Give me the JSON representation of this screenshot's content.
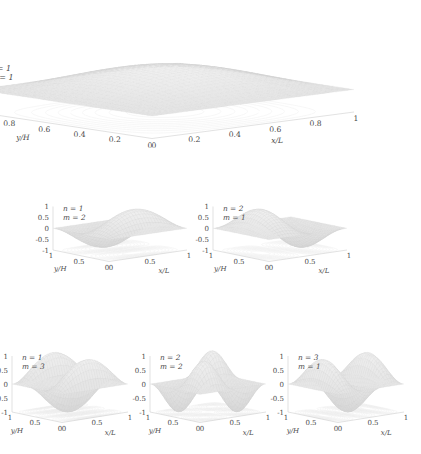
{
  "figure": {
    "axis_labels": {
      "x": "x/L",
      "y": "y/H",
      "z": ""
    }
  },
  "chart_data": {
    "type": "surface",
    "xlabel": "x/L",
    "ylabel": "y/H",
    "zlabel": "",
    "grid": false,
    "legend": "none",
    "panels": [
      {
        "id": "panel-n1-m1",
        "n": 1,
        "m": 1,
        "label_n": "n = 1",
        "label_m": "m = 1",
        "zlim": [
          0,
          2
        ],
        "zticks": [
          "2",
          "1.5",
          "1",
          "0.5",
          "0"
        ],
        "ztick_values": [
          2,
          1.5,
          1,
          0.5,
          0
        ],
        "xlim": [
          0,
          1
        ],
        "ylim": [
          0,
          1
        ],
        "xticks": [
          "0",
          "0.2",
          "0.4",
          "0.6",
          "0.8",
          "1"
        ],
        "xtick_values": [
          0,
          0.2,
          0.4,
          0.6,
          0.8,
          1
        ],
        "yticks": [
          "1",
          "0.8",
          "0.6",
          "0.4",
          "0.2",
          "0"
        ],
        "ytick_values": [
          1,
          0.8,
          0.6,
          0.4,
          0.2,
          0
        ],
        "xlabel": "x/L",
        "ylabel": "y/H",
        "offset": 1,
        "amplitude": 1,
        "size": "large"
      },
      {
        "id": "panel-n1-m2",
        "n": 1,
        "m": 2,
        "label_n": "n = 1",
        "label_m": "m = 2",
        "zlim": [
          -1,
          1
        ],
        "zticks": [
          "1",
          "0.5",
          "0",
          "-0.5",
          "-1"
        ],
        "ztick_values": [
          1,
          0.5,
          0,
          -0.5,
          -1
        ],
        "xlim": [
          0,
          1
        ],
        "ylim": [
          0,
          1
        ],
        "xticks": [
          "0",
          "0.5",
          "1"
        ],
        "xtick_values": [
          0,
          0.5,
          1
        ],
        "yticks": [
          "1",
          "0.5",
          "0"
        ],
        "ytick_values": [
          1,
          0.5,
          0
        ],
        "xlabel": "x/L",
        "ylabel": "y/H",
        "offset": 0,
        "amplitude": 1,
        "size": "small"
      },
      {
        "id": "panel-n2-m1",
        "n": 2,
        "m": 1,
        "label_n": "n = 2",
        "label_m": "m = 1",
        "zlim": [
          -1,
          1
        ],
        "zticks": [
          "1",
          "0.5",
          "0",
          "-0.5",
          "-1"
        ],
        "ztick_values": [
          1,
          0.5,
          0,
          -0.5,
          -1
        ],
        "xlim": [
          0,
          1
        ],
        "ylim": [
          0,
          1
        ],
        "xticks": [
          "0",
          "0.5",
          "1"
        ],
        "xtick_values": [
          0,
          0.5,
          1
        ],
        "yticks": [
          "1",
          "0.5",
          "0"
        ],
        "ytick_values": [
          1,
          0.5,
          0
        ],
        "xlabel": "x/L",
        "ylabel": "y/H",
        "offset": 0,
        "amplitude": 1,
        "size": "small"
      },
      {
        "id": "panel-n1-m3",
        "n": 1,
        "m": 3,
        "label_n": "n = 1",
        "label_m": "m = 3",
        "zlim": [
          -1,
          1
        ],
        "zticks": [
          "1",
          "0.5",
          "0",
          "-0.5",
          "-1"
        ],
        "ztick_values": [
          1,
          0.5,
          0,
          -0.5,
          -1
        ],
        "xlim": [
          0,
          1
        ],
        "ylim": [
          0,
          1
        ],
        "xticks": [
          "0",
          "0.5",
          "1"
        ],
        "xtick_values": [
          0,
          0.5,
          1
        ],
        "yticks": [
          "1",
          "0.5",
          "0"
        ],
        "ytick_values": [
          1,
          0.5,
          0
        ],
        "xlabel": "x/L",
        "ylabel": "y/H",
        "offset": 0,
        "amplitude": 1,
        "size": "small"
      },
      {
        "id": "panel-n2-m2",
        "n": 2,
        "m": 2,
        "label_n": "n = 2",
        "label_m": "m = 2",
        "zlim": [
          -1,
          1
        ],
        "zticks": [
          "1",
          "0.5",
          "0",
          "-0.5",
          "-1"
        ],
        "ztick_values": [
          1,
          0.5,
          0,
          -0.5,
          -1
        ],
        "xlim": [
          0,
          1
        ],
        "ylim": [
          0,
          1
        ],
        "xticks": [
          "0",
          "0.5",
          "1"
        ],
        "xtick_values": [
          0,
          0.5,
          1
        ],
        "yticks": [
          "1",
          "0.5",
          "0"
        ],
        "ytick_values": [
          1,
          0.5,
          0
        ],
        "xlabel": "x/L",
        "ylabel": "y/H",
        "offset": 0,
        "amplitude": 1,
        "size": "small"
      },
      {
        "id": "panel-n3-m1",
        "n": 3,
        "m": 1,
        "label_n": "n = 3",
        "label_m": "m = 1",
        "zlim": [
          -1,
          1
        ],
        "zticks": [
          "1",
          "0.5",
          "0",
          "-0.5",
          "-1"
        ],
        "ztick_values": [
          1,
          0.5,
          0,
          -0.5,
          -1
        ],
        "xlim": [
          0,
          1
        ],
        "ylim": [
          0,
          1
        ],
        "xticks": [
          "0",
          "0.5",
          "1"
        ],
        "xtick_values": [
          0,
          0.5,
          1
        ],
        "yticks": [
          "1",
          "0.5",
          "0"
        ],
        "ytick_values": [
          1,
          0.5,
          0
        ],
        "xlabel": "x/L",
        "ylabel": "y/H",
        "offset": 0,
        "amplitude": 1,
        "size": "small"
      }
    ]
  },
  "style": {
    "surface_fill": "#dcdcdc",
    "surface_stroke": "#c8c8c8",
    "contour_stroke": "#ebebeb",
    "axis_stroke": "#cfcfcf",
    "text_color": "#4a4a4a",
    "background": "#ffffff"
  }
}
